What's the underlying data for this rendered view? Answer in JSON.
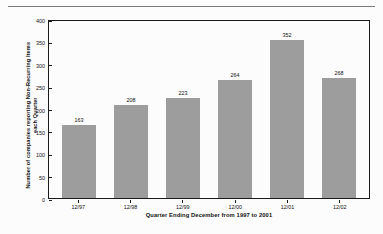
{
  "chart_data": {
    "type": "bar",
    "title": "",
    "categories": [
      "12/97",
      "12/98",
      "12/99",
      "12/00",
      "12/01",
      "12/02"
    ],
    "values": [
      163,
      208,
      223,
      264,
      352,
      268
    ],
    "data_labels": [
      "163",
      "208",
      "223",
      "264",
      "352",
      "268"
    ],
    "xlabel": "Quarter Ending December from 1997 to 2001",
    "ylabel": "Number of  companies reporting Non-Recurring Items each Quarter",
    "ylim": [
      0,
      400
    ],
    "ytick_labels": [
      "400",
      "350",
      "300",
      "250",
      "200",
      "150",
      "100",
      "50",
      "0"
    ],
    "ytick_values": [
      400,
      350,
      300,
      250,
      200,
      150,
      100,
      50,
      0
    ],
    "grid": false,
    "legend": false,
    "bar_color": "#9d9d9d",
    "axis_color": "#1a1a1a",
    "rule_color": "#7a7a7a"
  }
}
